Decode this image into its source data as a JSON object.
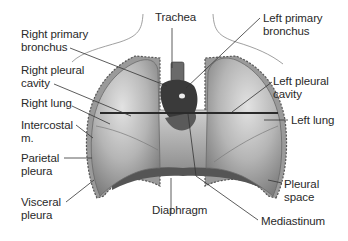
{
  "diagram": {
    "colors": {
      "lung_fill": "#b8b8b8",
      "lung_dark": "#7a7a7a",
      "leader_line": "#333333",
      "text": "#2a2a2a",
      "heart": "#3a3a3a"
    },
    "labels": {
      "trachea": "Trachea",
      "right_primary_bronchus_1": "Right primary",
      "right_primary_bronchus_2": "bronchus",
      "left_primary_bronchus_1": "Left primary",
      "left_primary_bronchus_2": "bronchus",
      "right_pleural_cavity_1": "Right pleural",
      "right_pleural_cavity_2": "cavity",
      "left_pleural_cavity_1": "Left pleural",
      "left_pleural_cavity_2": "cavity",
      "right_lung": "Right lung",
      "left_lung": "Left lung",
      "intercostal_1": "Intercostal",
      "intercostal_2": "m.",
      "parietal_pleura_1": "Parietal",
      "parietal_pleura_2": "pleura",
      "visceral_pleura_1": "Visceral",
      "visceral_pleura_2": "pleura",
      "pleural_space_1": "Pleural",
      "pleural_space_2": "space",
      "diaphragm": "Diaphragm",
      "mediastinum": "Mediastinum"
    }
  }
}
